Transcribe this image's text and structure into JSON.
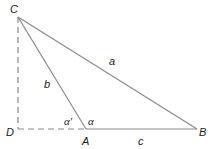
{
  "diagram": {
    "type": "triangle",
    "colors": {
      "stroke": "#8a8a8a",
      "text": "#222222",
      "background": "#ffffff"
    },
    "points": {
      "C": {
        "label": "C",
        "x": 18,
        "y": 17
      },
      "D": {
        "label": "D",
        "x": 18,
        "y": 129
      },
      "A": {
        "label": "A",
        "x": 86,
        "y": 129
      },
      "B": {
        "label": "B",
        "x": 197,
        "y": 129
      }
    },
    "sides": {
      "a": {
        "label": "a",
        "from": "C",
        "to": "B"
      },
      "b": {
        "label": "b",
        "from": "C",
        "to": "A"
      },
      "c": {
        "label": "c",
        "from": "A",
        "to": "B"
      }
    },
    "dashed": [
      {
        "from": "C",
        "to": "D"
      },
      {
        "from": "D",
        "to": "A"
      }
    ],
    "angles": {
      "alpha": {
        "label": "α",
        "at": "A"
      },
      "alpha_prime": {
        "label": "α′",
        "at": "A"
      }
    }
  }
}
